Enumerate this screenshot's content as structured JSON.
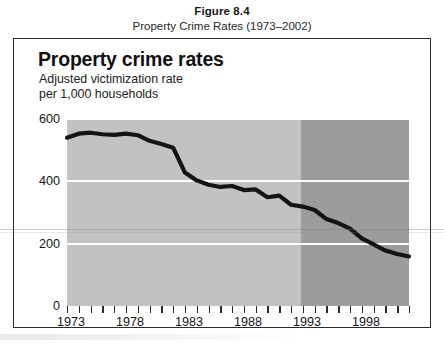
{
  "figure": {
    "number": "Figure 8.4",
    "caption": "Property Crime Rates (1973–2002)"
  },
  "chart_header": {
    "title": "Property crime rates",
    "subtitle": "Adjusted victimization rate\nper 1,000 households"
  },
  "colors": {
    "band_light": "#c2c2c2",
    "band_dark": "#9c9c9c",
    "line": "#141414",
    "gridline": "#ffffff",
    "frame": "#2b2b2b"
  },
  "axes": {
    "y_ticks": [
      "600",
      "400",
      "200",
      "0"
    ],
    "y_tick_values": [
      600,
      400,
      200,
      0
    ],
    "x_ticks_labeled": [
      "1973",
      "1978",
      "1983",
      "1988",
      "1993",
      "1998"
    ],
    "x_tick_years": [
      1973,
      1974,
      1975,
      1976,
      1977,
      1978,
      1979,
      1980,
      1981,
      1982,
      1983,
      1984,
      1985,
      1986,
      1987,
      1988,
      1989,
      1990,
      1991,
      1992,
      1993,
      1994,
      1995,
      1996,
      1997,
      1998,
      1999,
      2000,
      2001,
      2002
    ]
  },
  "chart_data": {
    "type": "line",
    "title": "Property crime rates",
    "subtitle": "Adjusted victimization rate per 1,000 households",
    "xlabel": "",
    "ylabel": "Adjusted victimization rate per 1,000 households",
    "xlim": [
      1973,
      2002
    ],
    "ylim": [
      0,
      600
    ],
    "grid": true,
    "gridlines_y": [
      600,
      400,
      200
    ],
    "legend": null,
    "shaded_regions": [
      {
        "name": "pre-redesign",
        "x_start": 1973,
        "x_end": 1993,
        "color": "#c2c2c2"
      },
      {
        "name": "post-redesign",
        "x_start": 1993,
        "x_end": 2002,
        "color": "#9c9c9c"
      }
    ],
    "x": [
      1973,
      1974,
      1975,
      1976,
      1977,
      1978,
      1979,
      1980,
      1981,
      1982,
      1983,
      1984,
      1985,
      1986,
      1987,
      1988,
      1989,
      1990,
      1991,
      1992,
      1993,
      1994,
      1995,
      1996,
      1997,
      1998,
      1999,
      2000,
      2001,
      2002
    ],
    "values": [
      540,
      553,
      556,
      551,
      549,
      553,
      548,
      530,
      520,
      508,
      428,
      403,
      389,
      382,
      385,
      372,
      374,
      349,
      354,
      325,
      319,
      308,
      279,
      266,
      248,
      217,
      198,
      178,
      167,
      159
    ],
    "series": [
      {
        "name": "Property crime rate",
        "values": [
          540,
          553,
          556,
          551,
          549,
          553,
          548,
          530,
          520,
          508,
          428,
          403,
          389,
          382,
          385,
          372,
          374,
          349,
          354,
          325,
          319,
          308,
          279,
          266,
          248,
          217,
          198,
          178,
          167,
          159
        ]
      }
    ]
  }
}
